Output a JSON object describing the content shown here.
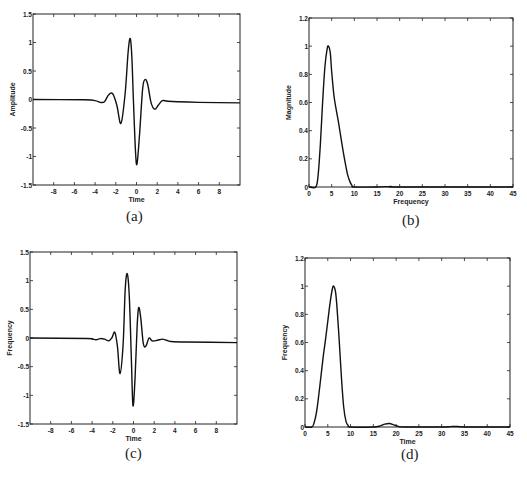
{
  "figure": {
    "captions": [
      "(a)",
      "(b)",
      "(c)",
      "(d)"
    ]
  },
  "chart_data": [
    {
      "id": "a",
      "type": "line",
      "title": "",
      "xlabel": "Time",
      "ylabel": "Amplitude",
      "xlim": [
        -10,
        10
      ],
      "ylim": [
        -1.5,
        1.5
      ],
      "xticks": [
        -8,
        -6,
        -4,
        -2,
        0,
        2,
        4,
        6,
        8
      ],
      "xticklabels": [
        "-8",
        "-6",
        "-4",
        "-2",
        "0",
        "2",
        "4",
        "6",
        "8"
      ],
      "yticks": [
        -1.5,
        -1,
        -0.5,
        0,
        0.5,
        1,
        1.5
      ],
      "yticklabels": [
        "-1.5",
        "-1",
        "-0.5",
        "0",
        "0.5",
        "1",
        "1.5"
      ],
      "grid": false,
      "series": [
        {
          "name": "wavelet",
          "x": [
            -10,
            -5,
            -4,
            -3.5,
            -3.1,
            -2.7,
            -2.3,
            -1.9,
            -1.5,
            -1.1,
            -0.8,
            -0.6,
            -0.45,
            -0.3,
            -0.1,
            0.05,
            0.3,
            0.6,
            0.85,
            1.1,
            1.4,
            1.75,
            2.1,
            2.5,
            3,
            4,
            6,
            10
          ],
          "y": [
            0,
            -0.005,
            -0.02,
            -0.05,
            -0.04,
            0.08,
            0.1,
            -0.1,
            -0.42,
            0.1,
            0.85,
            1.07,
            0.75,
            0.0,
            -0.9,
            -1.13,
            -0.6,
            0.2,
            0.35,
            0.25,
            -0.05,
            -0.17,
            -0.1,
            -0.02,
            -0.03,
            -0.04,
            -0.05,
            -0.06
          ]
        }
      ]
    },
    {
      "id": "b",
      "type": "line",
      "title": "",
      "xlabel": "Frequency",
      "ylabel": "Magnitude",
      "xlim": [
        0,
        45
      ],
      "ylim": [
        0,
        1.2
      ],
      "xticks": [
        0,
        5,
        10,
        15,
        20,
        25,
        30,
        35,
        40,
        45
      ],
      "xticklabels": [
        "0",
        "5",
        "10",
        "15",
        "20",
        "25",
        "30",
        "35",
        "40",
        "45"
      ],
      "yticks": [
        0,
        0.2,
        0.4,
        0.6,
        0.8,
        1,
        1.2
      ],
      "yticklabels": [
        "0",
        "0.2",
        "0.4",
        "0.6",
        "0.8",
        "1",
        "1.2"
      ],
      "grid": false,
      "series": [
        {
          "name": "magnitude spectrum",
          "x": [
            0,
            1.5,
            2,
            2.5,
            3,
            3.5,
            4,
            4.3,
            4.7,
            5,
            5.5,
            6,
            6.5,
            7,
            7.5,
            8,
            8.5,
            9,
            9.5,
            10,
            15,
            18,
            20,
            45
          ],
          "y": [
            0,
            0,
            0.08,
            0.3,
            0.6,
            0.85,
            0.98,
            1.0,
            0.95,
            0.82,
            0.65,
            0.55,
            0.46,
            0.36,
            0.26,
            0.17,
            0.09,
            0.04,
            0.01,
            0,
            0,
            0.004,
            0,
            0
          ]
        }
      ]
    },
    {
      "id": "c",
      "type": "line",
      "title": "",
      "xlabel": "Time",
      "ylabel": "Frequency",
      "xlim": [
        -10,
        10
      ],
      "ylim": [
        -1.5,
        1.5
      ],
      "xticks": [
        -8,
        -6,
        -4,
        -2,
        0,
        2,
        4,
        6,
        8
      ],
      "xticklabels": [
        "-8",
        "-6",
        "-4",
        "-2",
        "0",
        "2",
        "4",
        "6",
        "8"
      ],
      "yticks": [
        -1.5,
        -1,
        -0.5,
        0,
        0.5,
        1,
        1.5
      ],
      "yticklabels": [
        "-1.5",
        "-1",
        "-0.5",
        "0",
        "0.5",
        "1",
        "1.5"
      ],
      "grid": false,
      "series": [
        {
          "name": "wavelet",
          "x": [
            -10,
            -4.5,
            -4,
            -3.6,
            -3.2,
            -2.8,
            -2.4,
            -2.1,
            -1.8,
            -1.55,
            -1.3,
            -1.0,
            -0.8,
            -0.6,
            -0.4,
            -0.2,
            -0.05,
            0.15,
            0.35,
            0.5,
            0.7,
            0.95,
            1.2,
            1.5,
            1.8,
            2.3,
            2.8,
            3.2,
            3.6,
            5,
            10
          ],
          "y": [
            0,
            -0.01,
            -0.02,
            -0.03,
            -0.01,
            -0.02,
            -0.05,
            0.0,
            0.1,
            -0.15,
            -0.62,
            -0.1,
            0.85,
            1.12,
            0.7,
            -0.4,
            -1.18,
            -0.7,
            0.2,
            0.53,
            0.35,
            -0.1,
            -0.14,
            0.0,
            -0.05,
            -0.04,
            -0.02,
            -0.04,
            -0.06,
            -0.07,
            -0.08
          ]
        }
      ]
    },
    {
      "id": "d",
      "type": "line",
      "title": "",
      "xlabel": "Time",
      "ylabel": "Frequency",
      "xlim": [
        0,
        45
      ],
      "ylim": [
        0,
        1.2
      ],
      "xticks": [
        0,
        5,
        10,
        15,
        20,
        25,
        30,
        35,
        40,
        45
      ],
      "xticklabels": [
        "0",
        "5",
        "10",
        "15",
        "20",
        "25",
        "30",
        "35",
        "40",
        "45"
      ],
      "yticks": [
        0,
        0.2,
        0.4,
        0.6,
        0.8,
        1,
        1.2
      ],
      "yticklabels": [
        "0",
        "0.2",
        "0.4",
        "0.6",
        "0.8",
        "1",
        "1.2"
      ],
      "grid": false,
      "series": [
        {
          "name": "spectrum",
          "x": [
            0,
            1.5,
            2,
            2.5,
            3,
            3.5,
            4,
            4.5,
            5,
            5.5,
            6,
            6.3,
            6.7,
            7,
            7.5,
            8,
            8.5,
            9,
            9.5,
            10,
            15,
            16.5,
            17.5,
            18.5,
            19.5,
            20.5,
            22,
            30,
            32,
            33,
            34,
            36,
            45
          ],
          "y": [
            0,
            0,
            0.03,
            0.1,
            0.22,
            0.36,
            0.5,
            0.62,
            0.75,
            0.88,
            0.98,
            1.0,
            0.96,
            0.86,
            0.62,
            0.35,
            0.14,
            0.04,
            0.01,
            0,
            0,
            0.008,
            0.02,
            0.025,
            0.015,
            0.004,
            0,
            0,
            0.003,
            0.004,
            0.002,
            0,
            0
          ]
        }
      ]
    }
  ]
}
